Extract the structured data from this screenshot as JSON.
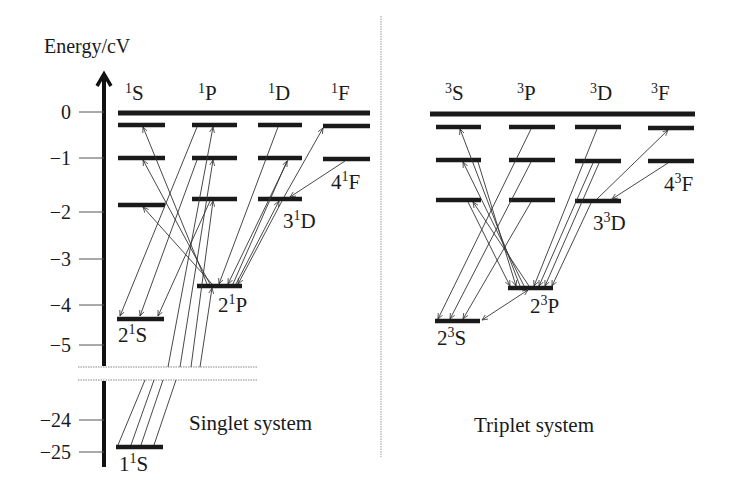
{
  "figure": {
    "axis_title": "Energy/cV",
    "y_ticks": [
      {
        "label": "0",
        "value": 0
      },
      {
        "label": "−1",
        "value": -1
      },
      {
        "label": "−2",
        "value": -2
      },
      {
        "label": "−3",
        "value": -3
      },
      {
        "label": "−4",
        "value": -4
      },
      {
        "label": "−5",
        "value": -5
      },
      {
        "label": "−24",
        "value": -24
      },
      {
        "label": "−25",
        "value": -25
      }
    ],
    "axis_break": {
      "between": [
        -5,
        -24
      ]
    },
    "singlet": {
      "title": "Singlet system",
      "columns": [
        {
          "id": "S",
          "label_sup": "1",
          "label": "S"
        },
        {
          "id": "P",
          "label_sup": "1",
          "label": "P"
        },
        {
          "id": "D",
          "label_sup": "1",
          "label": "D"
        },
        {
          "id": "F",
          "label_sup": "1",
          "label": "F"
        }
      ],
      "labeled_levels": [
        {
          "term": "1S",
          "n": "1",
          "sup": "1",
          "L": "S",
          "energy": -24.6
        },
        {
          "term": "2S",
          "n": "2",
          "sup": "1",
          "L": "S",
          "energy": -4.0
        },
        {
          "term": "2P",
          "n": "2",
          "sup": "1",
          "L": "P",
          "energy": -3.4
        },
        {
          "term": "3D",
          "n": "3",
          "sup": "1",
          "L": "D",
          "energy": -1.5
        },
        {
          "term": "4F",
          "n": "4",
          "sup": "1",
          "L": "F",
          "energy": -0.85
        }
      ],
      "levels": {
        "S": [
          -24.6,
          -4.0,
          -1.7,
          -1.0,
          -0.3
        ],
        "P": [
          -3.4,
          -1.5,
          -1.0,
          -0.3
        ],
        "D": [
          -1.5,
          -1.0,
          -0.3
        ],
        "F": [
          -0.85,
          -0.3
        ]
      }
    },
    "triplet": {
      "title": "Triplet system",
      "columns": [
        {
          "id": "S",
          "label_sup": "3",
          "label": "S"
        },
        {
          "id": "P",
          "label_sup": "3",
          "label": "P"
        },
        {
          "id": "D",
          "label_sup": "3",
          "label": "D"
        },
        {
          "id": "F",
          "label_sup": "3",
          "label": "F"
        }
      ],
      "labeled_levels": [
        {
          "term": "2S",
          "n": "2",
          "sup": "3",
          "L": "S",
          "energy": -4.8
        },
        {
          "term": "2P",
          "n": "2",
          "sup": "3",
          "L": "P",
          "energy": -3.6
        },
        {
          "term": "3D",
          "n": "3",
          "sup": "3",
          "L": "D",
          "energy": -1.5
        },
        {
          "term": "4F",
          "n": "4",
          "sup": "3",
          "L": "F",
          "energy": -0.85
        }
      ],
      "levels": {
        "S": [
          -4.8,
          -1.9,
          -1.0,
          -0.3
        ],
        "P": [
          -3.6,
          -1.6,
          -1.0,
          -0.3
        ],
        "D": [
          -1.5,
          -1.0,
          -0.3
        ],
        "F": [
          -0.85,
          -0.3
        ]
      }
    }
  }
}
